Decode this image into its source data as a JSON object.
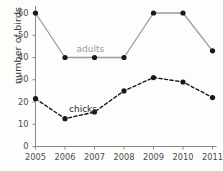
{
  "chart_data": {
    "type": "line",
    "title": "",
    "xlabel": "",
    "ylabel": "number of birds",
    "x": [
      2005,
      2006,
      2007,
      2008,
      2009,
      2010,
      2011
    ],
    "categories": [
      "2005",
      "2006",
      "2007",
      "2008",
      "2009",
      "2010",
      "2011"
    ],
    "xlim": [
      2005,
      2011
    ],
    "ylim": [
      0,
      62
    ],
    "yticks": [
      0,
      10,
      20,
      30,
      40,
      50,
      60
    ],
    "ytick_labels": [
      "0",
      "10",
      "20",
      "30",
      "40",
      "50",
      "60"
    ],
    "xtick_labels": [
      "2005",
      "2006",
      "2007",
      "2008",
      "2009",
      "2010",
      "2011"
    ],
    "grid": false,
    "legend": "inline-labels",
    "series": [
      {
        "name": "adults",
        "values": [
          60,
          40,
          40,
          40,
          60,
          60,
          43
        ],
        "line_style": "solid",
        "line_color": "#9a9a9a",
        "marker": "circle",
        "marker_color": "#1a1a1a",
        "label_position": "above-line-between-2006-and-2008"
      },
      {
        "name": "chicks",
        "values": [
          21.5,
          12.5,
          15.5,
          25,
          31,
          29,
          22
        ],
        "line_style": "dashed",
        "line_color": "#1a1a1a",
        "marker": "circle",
        "marker_color": "#1a1a1a",
        "label_position": "above-line-near-2006"
      }
    ],
    "colors": {
      "background": "#fdfdfc",
      "axis": "#8a8a8a",
      "tick_text": "#4a4a4a",
      "axis_label": "#3a3a3a",
      "adults_line": "#9a9a9a",
      "chicks_line": "#1a1a1a",
      "marker": "#1a1a1a"
    }
  },
  "labels": {
    "adults": "adults",
    "chicks": "chicks"
  }
}
